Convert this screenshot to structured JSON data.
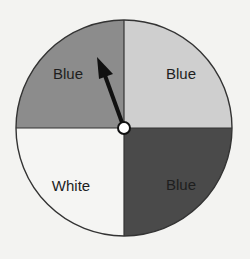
{
  "spinner": {
    "title": "",
    "sections": [
      {
        "position": "top-left",
        "label": "Blue",
        "fill": "#8c8c8c"
      },
      {
        "position": "top-right",
        "label": "Blue",
        "fill": "#cfcfcf"
      },
      {
        "position": "bottom-left",
        "label": "White",
        "fill": "#f5f5f3"
      },
      {
        "position": "bottom-right",
        "label": "Blue",
        "fill": "#4a4a4a"
      }
    ],
    "arrow": {
      "points_to": "top-left",
      "color": "#111111"
    },
    "outline_color": "#333333",
    "background": "#f3f3f1"
  }
}
